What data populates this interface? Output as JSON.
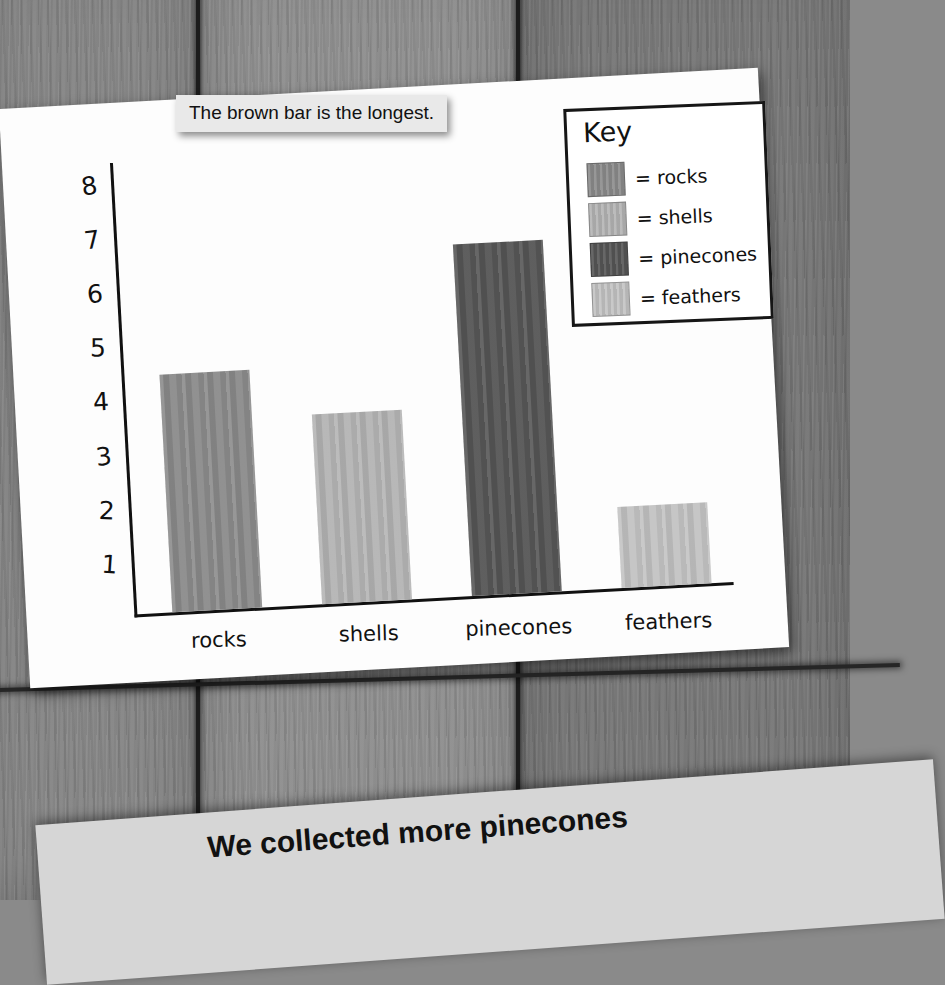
{
  "tooltip": {
    "text": "The brown bar is the longest."
  },
  "caption": {
    "text": "We collected more pinecones"
  },
  "key": {
    "title": "Key",
    "entries": [
      {
        "label": "= rocks",
        "color": "#8b8b8b"
      },
      {
        "label": "= shells",
        "color": "#b4b4b4"
      },
      {
        "label": "= pinecones",
        "color": "#565656"
      },
      {
        "label": "= feathers",
        "color": "#c3c3c3"
      }
    ]
  },
  "chart_data": {
    "type": "bar",
    "title": "",
    "xlabel": "",
    "ylabel": "",
    "categories": [
      "rocks",
      "shells",
      "pinecones",
      "feathers"
    ],
    "values": [
      4.4,
      3.5,
      6.5,
      1.5
    ],
    "colors": [
      "#8b8b8b",
      "#b4b4b4",
      "#565656",
      "#c3c3c3"
    ],
    "ylim": [
      0,
      8.4
    ],
    "yticks": [
      8,
      7,
      6,
      5,
      4,
      3,
      2,
      1
    ],
    "ytick_labels": [
      "8",
      "7",
      "6",
      "5",
      "4",
      "3",
      "2",
      "1"
    ],
    "grid": false,
    "legend": "Key box, top right inside chart"
  }
}
